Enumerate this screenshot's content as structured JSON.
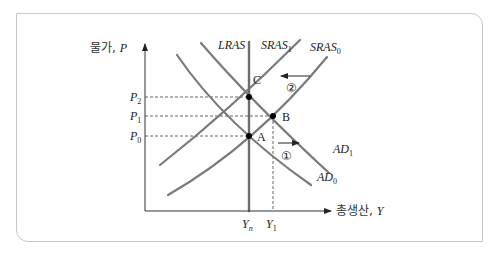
{
  "diagram": {
    "type": "AD-AS model",
    "y_axis": {
      "label_kr": "물가",
      "label_var": "P"
    },
    "x_axis": {
      "label_kr": "총생산",
      "label_var": "Y"
    },
    "price_levels": [
      {
        "id": "P2",
        "base": "P",
        "sub": "2"
      },
      {
        "id": "P1",
        "base": "P",
        "sub": "1"
      },
      {
        "id": "P0",
        "base": "P",
        "sub": "0"
      }
    ],
    "output_levels": [
      {
        "id": "Yn",
        "base": "Y",
        "sub": "n"
      },
      {
        "id": "Y1",
        "base": "Y",
        "sub": "1"
      }
    ],
    "curves": {
      "lras": {
        "label": "LRAS"
      },
      "sras1": {
        "base": "SRAS",
        "sub": "1"
      },
      "sras0": {
        "base": "SRAS",
        "sub": "0"
      },
      "ad1": {
        "base": "AD",
        "sub": "1"
      },
      "ad0": {
        "base": "AD",
        "sub": "0"
      }
    },
    "points": [
      {
        "label": "C"
      },
      {
        "label": "B"
      },
      {
        "label": "A"
      }
    ],
    "shifts": [
      {
        "label": "①",
        "direction": "right",
        "curve": "AD0 → AD1"
      },
      {
        "label": "②",
        "direction": "left",
        "curve": "SRAS0 → SRAS1"
      }
    ],
    "colors": {
      "curve": "#7a7a7a",
      "lras": "#6e6e6e",
      "axis": "#333333",
      "frame": "#c8c8c8",
      "point": "#000000"
    }
  }
}
